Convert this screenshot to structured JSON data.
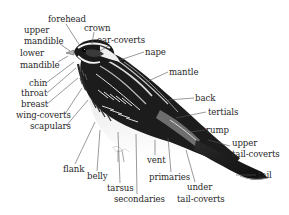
{
  "diagram": {
    "colors": {
      "background": "#ffffff",
      "label_text": "#2a2a2a",
      "leader_line": "#555555",
      "plumage_dark": "#1a1a1a",
      "plumage_light": "#f2f2f2",
      "plumage_mid": "#8a8a8a"
    },
    "labels": [
      {
        "id": "forehead",
        "text": "forehead"
      },
      {
        "id": "crown",
        "text": "crown"
      },
      {
        "id": "upper_mandible_1",
        "text": "upper"
      },
      {
        "id": "upper_mandible_2",
        "text": "mandible"
      },
      {
        "id": "ear_coverts",
        "text": "ear-coverts"
      },
      {
        "id": "nape",
        "text": "nape"
      },
      {
        "id": "lower_mandible_1",
        "text": "lower"
      },
      {
        "id": "lower_mandible_2",
        "text": "mandible"
      },
      {
        "id": "mantle",
        "text": "mantle"
      },
      {
        "id": "chin",
        "text": "chin"
      },
      {
        "id": "throat",
        "text": "throat"
      },
      {
        "id": "back",
        "text": "back"
      },
      {
        "id": "breast",
        "text": "breast"
      },
      {
        "id": "wing_coverts",
        "text": "wing-coverts"
      },
      {
        "id": "tertials",
        "text": "tertials"
      },
      {
        "id": "scapulars",
        "text": "scapulars"
      },
      {
        "id": "rump",
        "text": "rump"
      },
      {
        "id": "upper_tail_coverts_1",
        "text": "upper"
      },
      {
        "id": "upper_tail_coverts_2",
        "text": "tail-coverts"
      },
      {
        "id": "vent",
        "text": "vent"
      },
      {
        "id": "tail",
        "text": "tail"
      },
      {
        "id": "flank",
        "text": "flank"
      },
      {
        "id": "primaries",
        "text": "primaries"
      },
      {
        "id": "belly",
        "text": "belly"
      },
      {
        "id": "under_tail_coverts_1",
        "text": "under"
      },
      {
        "id": "tarsus",
        "text": "tarsus"
      },
      {
        "id": "secondaries",
        "text": "secondaries"
      },
      {
        "id": "under_tail_coverts_2",
        "text": "tail-coverts"
      }
    ]
  }
}
